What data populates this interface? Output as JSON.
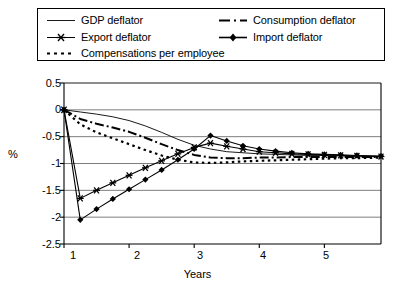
{
  "chart_data": {
    "type": "line",
    "title": "",
    "xlabel": "Years",
    "ylabel": "%",
    "xlim": [
      1,
      5.87
    ],
    "ylim": [
      -2.5,
      0.5
    ],
    "xticks": [
      1,
      2,
      3,
      4,
      5
    ],
    "xtick_labels": [
      "1",
      "2",
      "3",
      "4",
      "5"
    ],
    "yticks": [
      0.5,
      0,
      -0.5,
      -1,
      -1.5,
      -2,
      -2.5
    ],
    "ytick_labels": [
      "0.5",
      "0",
      "-0.5",
      "-1",
      "-1.5",
      "-2",
      "-2.5"
    ],
    "grid": "horizontal",
    "legend_position": "top",
    "series": [
      {
        "name": "GDP deflator",
        "style": "solid-thin",
        "marker": "none",
        "color": "#000000",
        "x": [
          1,
          1.25,
          1.5,
          1.75,
          2,
          2.25,
          2.5,
          2.75,
          3,
          3.25,
          3.5,
          3.75,
          4,
          4.25,
          4.5,
          4.75,
          5,
          5.25,
          5.5,
          5.87
        ],
        "y": [
          0,
          -0.04,
          -0.08,
          -0.13,
          -0.2,
          -0.3,
          -0.42,
          -0.55,
          -0.66,
          -0.73,
          -0.78,
          -0.8,
          -0.82,
          -0.83,
          -0.84,
          -0.85,
          -0.85,
          -0.86,
          -0.86,
          -0.87
        ]
      },
      {
        "name": "Consumption deflator",
        "style": "dash-dot",
        "marker": "none",
        "color": "#000000",
        "x": [
          1,
          1.25,
          1.5,
          1.75,
          2,
          2.25,
          2.5,
          2.75,
          3,
          3.25,
          3.5,
          3.75,
          4,
          4.25,
          4.5,
          4.75,
          5,
          5.25,
          5.5,
          5.87
        ],
        "y": [
          0,
          -0.17,
          -0.26,
          -0.33,
          -0.41,
          -0.52,
          -0.64,
          -0.75,
          -0.84,
          -0.89,
          -0.9,
          -0.9,
          -0.89,
          -0.89,
          -0.88,
          -0.88,
          -0.88,
          -0.88,
          -0.88,
          -0.88
        ]
      },
      {
        "name": "Compensations per employee",
        "style": "dotted",
        "marker": "none",
        "color": "#000000",
        "x": [
          1,
          1.25,
          1.5,
          1.75,
          2,
          2.25,
          2.5,
          2.75,
          3,
          3.25,
          3.5,
          3.75,
          4,
          4.25,
          4.5,
          4.75,
          5,
          5.25,
          5.5,
          5.87
        ],
        "y": [
          0,
          -0.27,
          -0.42,
          -0.53,
          -0.64,
          -0.75,
          -0.85,
          -0.93,
          -0.98,
          -0.99,
          -0.98,
          -0.96,
          -0.95,
          -0.94,
          -0.93,
          -0.92,
          -0.91,
          -0.9,
          -0.9,
          -0.89
        ]
      },
      {
        "name": "Export deflator",
        "style": "solid-marker",
        "marker": "star",
        "color": "#000000",
        "x": [
          1,
          1.25,
          1.5,
          1.75,
          2,
          2.25,
          2.5,
          2.75,
          3,
          3.25,
          3.5,
          3.75,
          4,
          4.25,
          4.5,
          4.75,
          5,
          5.25,
          5.5,
          5.87
        ],
        "y": [
          0,
          -1.65,
          -1.5,
          -1.36,
          -1.22,
          -1.08,
          -0.95,
          -0.82,
          -0.7,
          -0.62,
          -0.68,
          -0.73,
          -0.78,
          -0.8,
          -0.82,
          -0.83,
          -0.84,
          -0.85,
          -0.86,
          -0.87
        ]
      },
      {
        "name": "Import deflator",
        "style": "solid-marker",
        "marker": "diamond",
        "color": "#000000",
        "x": [
          1,
          1.25,
          1.5,
          1.75,
          2,
          2.25,
          2.5,
          2.75,
          3,
          3.25,
          3.5,
          3.75,
          4,
          4.25,
          4.5,
          4.75,
          5,
          5.25,
          5.5,
          5.87
        ],
        "y": [
          0,
          -2.05,
          -1.85,
          -1.66,
          -1.48,
          -1.3,
          -1.12,
          -0.93,
          -0.73,
          -0.48,
          -0.58,
          -0.67,
          -0.73,
          -0.77,
          -0.8,
          -0.82,
          -0.83,
          -0.84,
          -0.85,
          -0.86
        ]
      }
    ]
  },
  "legend": {
    "items": [
      {
        "label": "GDP deflator",
        "key": "solid-thin-key"
      },
      {
        "label": "Consumption deflator",
        "key": "dash-dot-key"
      },
      {
        "label": "Export deflator",
        "key": "star-marker-key"
      },
      {
        "label": "Import deflator",
        "key": "diamond-marker-key"
      },
      {
        "label": "Compensations per employee",
        "key": "dotted-key"
      }
    ]
  },
  "axes": {
    "y_title": "%",
    "x_title": "Years"
  }
}
